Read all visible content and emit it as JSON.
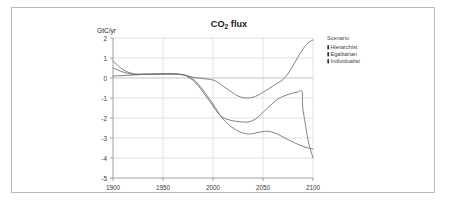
{
  "figure": {
    "border_color": "#b9b9b9",
    "background": "#ffffff"
  },
  "chart_data": {
    "type": "line",
    "title": "CO2 flux",
    "title_main": "CO",
    "title_sub": "2",
    "title_tail": " flux",
    "xlabel": "",
    "ylabel": "GtC/yr",
    "xlim": [
      1900,
      2100
    ],
    "ylim": [
      -5,
      2
    ],
    "grid": true,
    "legend_position": "right-outside",
    "legend_title": "Scenario",
    "xticks": [
      1900,
      1950,
      2000,
      2050,
      2100
    ],
    "xtick_labels": [
      "1900",
      "1950",
      "2000",
      "2050",
      "2100"
    ],
    "yticks": [
      2,
      1,
      0,
      -1,
      -2,
      -3,
      -4,
      -5
    ],
    "ytick_labels": [
      "2",
      "1",
      "0",
      "-1",
      "-2",
      "-3",
      "-4",
      "-5"
    ],
    "line_color": "#6d6d6d",
    "series": [
      {
        "name": "Hierarchist",
        "x": [
          1900,
          1910,
          1920,
          1930,
          1940,
          1950,
          1960,
          1970,
          1975,
          1980,
          1985,
          1990,
          1995,
          2000,
          2005,
          2010,
          2015,
          2020,
          2025,
          2030,
          2035,
          2040,
          2045,
          2050,
          2055,
          2060,
          2065,
          2070,
          2075,
          2080,
          2085,
          2090,
          2095,
          2100
        ],
        "values": [
          0.5,
          0.3,
          0.18,
          0.18,
          0.19,
          0.2,
          0.2,
          0.16,
          0.08,
          -0.05,
          -0.3,
          -0.6,
          -0.95,
          -1.3,
          -1.7,
          -2.05,
          -2.3,
          -2.5,
          -2.65,
          -2.75,
          -2.8,
          -2.78,
          -2.72,
          -2.68,
          -2.66,
          -2.72,
          -2.82,
          -2.95,
          -3.08,
          -3.2,
          -3.32,
          -3.42,
          -3.5,
          -3.55
        ]
      },
      {
        "name": "Egalitarian",
        "x": [
          1900,
          1910,
          1920,
          1930,
          1940,
          1950,
          1960,
          1970,
          1975,
          1980,
          1985,
          1990,
          1995,
          2000,
          2005,
          2010,
          2015,
          2020,
          2025,
          2030,
          2035,
          2040,
          2045,
          2050,
          2055,
          2060,
          2065,
          2070,
          2075,
          2080,
          2085,
          2089,
          2090,
          2095,
          2100
        ],
        "values": [
          0.85,
          0.42,
          0.22,
          0.2,
          0.2,
          0.21,
          0.21,
          0.17,
          0.05,
          -0.12,
          -0.38,
          -0.7,
          -1.05,
          -1.4,
          -1.75,
          -1.98,
          -2.08,
          -2.14,
          -2.18,
          -2.2,
          -2.2,
          -2.12,
          -1.95,
          -1.72,
          -1.48,
          -1.25,
          -1.05,
          -0.92,
          -0.82,
          -0.75,
          -0.7,
          -0.68,
          -1.6,
          -3.1,
          -4.0
        ]
      },
      {
        "name": "Individualist",
        "x": [
          1900,
          1910,
          1920,
          1930,
          1940,
          1950,
          1960,
          1970,
          1975,
          1980,
          1985,
          1990,
          1995,
          2000,
          2005,
          2010,
          2015,
          2020,
          2025,
          2030,
          2035,
          2040,
          2045,
          2050,
          2055,
          2060,
          2065,
          2070,
          2075,
          2080,
          2085,
          2090,
          2095,
          2100
        ],
        "values": [
          0.1,
          0.12,
          0.15,
          0.18,
          0.19,
          0.2,
          0.2,
          0.16,
          0.1,
          0.04,
          0.0,
          -0.03,
          -0.06,
          -0.1,
          -0.22,
          -0.4,
          -0.58,
          -0.75,
          -0.9,
          -0.98,
          -1.0,
          -0.96,
          -0.86,
          -0.72,
          -0.56,
          -0.4,
          -0.24,
          -0.08,
          0.22,
          0.62,
          1.05,
          1.45,
          1.75,
          1.9
        ]
      }
    ]
  },
  "legend": {
    "title": "Scenario",
    "items": [
      {
        "label": "Hierarchist"
      },
      {
        "label": "Egalitarian"
      },
      {
        "label": "Individualist"
      }
    ]
  }
}
